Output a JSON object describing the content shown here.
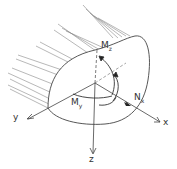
{
  "diagram": {
    "type": "beam cross-section internal forces",
    "labels": {
      "mz": "M",
      "mz_sub": "z",
      "my": "M",
      "my_sub": "y",
      "nx": "N",
      "nx_sub": "x",
      "axis_x": "x",
      "axis_y": "y",
      "axis_z": "z"
    },
    "colors": {
      "stroke": "#444444",
      "hatch": "#777777",
      "background": "#ffffff"
    }
  }
}
